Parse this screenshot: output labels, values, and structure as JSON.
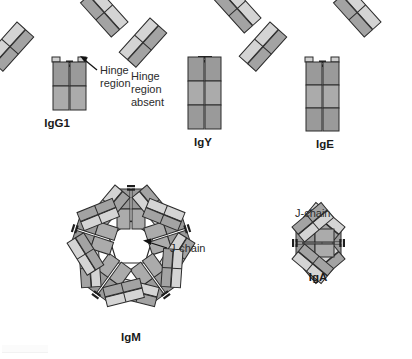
{
  "figure": {
    "background_color": "#ffffff",
    "palette": {
      "light_chain_fill": "#c9c9c9",
      "light_chain_fill_pale": "#d8d8d8",
      "heavy_chain_fill": "#a0a0a0",
      "heavy_chain_fill_dark": "#8f8f8f",
      "stem_fill": "#9a9a9a",
      "stem_fill_light": "#ababab",
      "outline": "#2b2b2b",
      "jchain_fill": "#ffffff",
      "hinge_connector": "#1e1e1e",
      "text_color": "#2b2b2b"
    },
    "molecules": [
      {
        "id": "igg1",
        "label": "IgG1",
        "label_x": 57,
        "label_y": 127,
        "hinge": "present",
        "stem_segments": 2,
        "arms": 2,
        "center_x": 72,
        "top_y": 20
      },
      {
        "id": "igy",
        "label": "IgY",
        "label_x": 203,
        "label_y": 146,
        "hinge": "absent",
        "stem_segments": 3,
        "arms": 2,
        "center_x": 205,
        "top_y": 16
      },
      {
        "id": "ige",
        "label": "IgE",
        "label_x": 325,
        "label_y": 148,
        "hinge": "present",
        "stem_segments": 3,
        "arms": 2,
        "center_x": 325,
        "top_y": 20
      },
      {
        "id": "igm",
        "label": "IgM",
        "label_x": 131,
        "label_y": 341,
        "hinge": "present",
        "structure": "pentamer",
        "monomers": 5,
        "center_x": 131,
        "center_y": 247
      },
      {
        "id": "iga",
        "label": "IgA",
        "label_x": 318,
        "label_y": 281,
        "hinge": "present",
        "structure": "dimer",
        "monomers": 2,
        "center_x": 318,
        "center_y": 243
      }
    ],
    "annotations": [
      {
        "id": "hinge-region",
        "lines": [
          "Hinge",
          "region"
        ],
        "x": 100,
        "y": 74,
        "line_height": 13,
        "arrow": {
          "from_x": 97,
          "from_y": 70,
          "to_x": 81,
          "to_y": 57
        },
        "target_molecule": "igg1"
      },
      {
        "id": "hinge-region-absent",
        "lines": [
          "Hinge",
          "region",
          "absent"
        ],
        "x": 131,
        "y": 80,
        "line_height": 13,
        "arrow": null,
        "target_molecule": "igy"
      },
      {
        "id": "jchain-igm",
        "lines": [
          "J-chain"
        ],
        "x": 170,
        "y": 252,
        "line_height": 13,
        "arrow": {
          "from_x": 167,
          "from_y": 248,
          "to_x": 144,
          "to_y": 241
        },
        "target_molecule": "igm"
      },
      {
        "id": "jchain-iga",
        "lines": [
          "J-chain"
        ],
        "x": 295,
        "y": 217,
        "line_height": 13,
        "arrow": null,
        "target_molecule": "iga"
      }
    ]
  }
}
